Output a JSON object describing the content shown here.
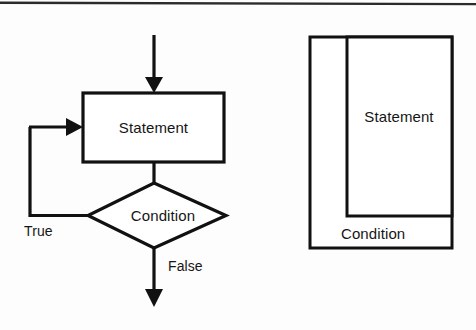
{
  "figure": {
    "caption_present": false,
    "background_color": "#fdfdfd",
    "ink_color": "#111111"
  },
  "flowchart": {
    "title": "",
    "statement_box": {
      "label": "Statement"
    },
    "decision_diamond": {
      "label": "Condition"
    },
    "edges": [
      {
        "name": "entry",
        "label": ""
      },
      {
        "name": "statement-to-condition",
        "label": ""
      },
      {
        "name": "loop-back-true",
        "label": "True"
      },
      {
        "name": "exit-false",
        "label": "False"
      }
    ],
    "true_label": "True",
    "false_label": "False"
  },
  "nassi_shneiderman": {
    "statement_label": "Statement",
    "condition_label": "Condition"
  }
}
